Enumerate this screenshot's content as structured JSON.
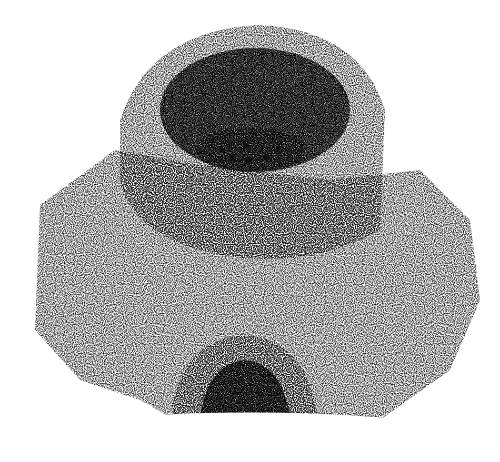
{
  "image": {
    "subject": "stippled illustration of a circular clay kiln with arched firing opening",
    "style": "black ink stipple on white",
    "colors": {
      "background": "#ffffff",
      "ink": "#111111"
    }
  }
}
